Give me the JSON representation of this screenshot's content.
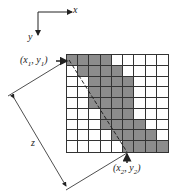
{
  "diagram": {
    "axes": {
      "x_label": "x",
      "y_label": "y"
    },
    "point_start": {
      "label": "(x",
      "sub": "1",
      "comma": ", y",
      "sub2": "1",
      "close": ")"
    },
    "point_end": {
      "label": "(x",
      "sub": "2",
      "comma": ", y",
      "sub2": "2",
      "close": ")"
    },
    "distance_label": "z",
    "grid": {
      "rows": 9,
      "cols": 9,
      "fill_color": "#8c8c8c",
      "shaded_cells_by_row": [
        [
          0,
          1,
          2,
          3
        ],
        [
          1,
          2,
          3,
          4
        ],
        [
          2,
          3,
          4,
          5
        ],
        [
          2,
          3,
          4,
          5
        ],
        [
          2,
          3,
          4,
          5
        ],
        [
          3,
          4,
          5
        ],
        [
          3,
          4,
          5,
          6
        ],
        [
          4,
          5,
          6,
          7
        ],
        [
          5,
          6,
          7,
          8
        ]
      ]
    }
  }
}
